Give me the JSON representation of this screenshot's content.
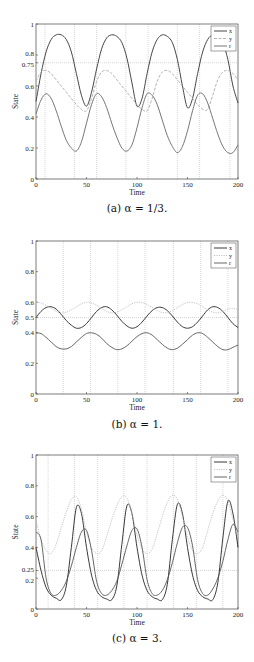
{
  "chart_data": [
    {
      "type": "line",
      "caption": "(a) α = 1/3.",
      "xlabel": "Time",
      "ylabel": "State",
      "xlim": [
        0,
        200
      ],
      "ylim": [
        0,
        1
      ],
      "xticks": [
        "0",
        "50",
        "100",
        "150",
        "200"
      ],
      "xtick_values": [
        0,
        50,
        100,
        150,
        200
      ],
      "yticks": [
        "0",
        "0.2",
        "0.4",
        "0.6",
        "0.75",
        "0.8",
        "1"
      ],
      "ytick_values": [
        0,
        0.2,
        0.4,
        0.6,
        0.75,
        0.8,
        1
      ],
      "hline": 0.75,
      "vlines": [
        9,
        38,
        60,
        89,
        111,
        140,
        162,
        192
      ],
      "legend": [
        "x",
        "y",
        "r"
      ],
      "legend_position": "top-right",
      "x": [
        0,
        5,
        10,
        15,
        20,
        25,
        30,
        35,
        40,
        45,
        50,
        55,
        60,
        65,
        70,
        75,
        80,
        85,
        90,
        95,
        100,
        105,
        110,
        115,
        120,
        125,
        130,
        135,
        140,
        145,
        150,
        155,
        160,
        165,
        170,
        175,
        180,
        185,
        190,
        195,
        200
      ],
      "series": [
        {
          "name": "x",
          "style": "solid",
          "color": "#333333",
          "values": [
            0.5,
            0.68,
            0.82,
            0.9,
            0.93,
            0.93,
            0.9,
            0.82,
            0.68,
            0.54,
            0.47,
            0.56,
            0.71,
            0.84,
            0.91,
            0.93,
            0.92,
            0.88,
            0.78,
            0.62,
            0.47,
            0.52,
            0.68,
            0.82,
            0.9,
            0.93,
            0.92,
            0.88,
            0.77,
            0.6,
            0.46,
            0.52,
            0.68,
            0.82,
            0.9,
            0.93,
            0.92,
            0.88,
            0.77,
            0.6,
            0.49
          ]
        },
        {
          "name": "y",
          "style": "dashed",
          "color": "#aaaaaa",
          "values": [
            0.63,
            0.69,
            0.7,
            0.68,
            0.64,
            0.6,
            0.56,
            0.52,
            0.48,
            0.45,
            0.44,
            0.52,
            0.63,
            0.69,
            0.7,
            0.68,
            0.64,
            0.6,
            0.56,
            0.52,
            0.48,
            0.45,
            0.44,
            0.52,
            0.63,
            0.69,
            0.7,
            0.68,
            0.64,
            0.6,
            0.56,
            0.52,
            0.48,
            0.45,
            0.45,
            0.54,
            0.64,
            0.69,
            0.7,
            0.68,
            0.64
          ]
        },
        {
          "name": "r",
          "style": "solid",
          "color": "#666666",
          "values": [
            0.42,
            0.51,
            0.55,
            0.52,
            0.44,
            0.34,
            0.25,
            0.2,
            0.18,
            0.24,
            0.36,
            0.48,
            0.55,
            0.53,
            0.46,
            0.36,
            0.27,
            0.2,
            0.18,
            0.22,
            0.33,
            0.46,
            0.55,
            0.54,
            0.48,
            0.38,
            0.28,
            0.21,
            0.17,
            0.21,
            0.31,
            0.44,
            0.54,
            0.55,
            0.49,
            0.39,
            0.29,
            0.21,
            0.17,
            0.17,
            0.22
          ]
        }
      ]
    },
    {
      "type": "line",
      "caption": "(b) α = 1.",
      "xlabel": "Time",
      "ylabel": "State",
      "xlim": [
        0,
        200
      ],
      "ylim": [
        0,
        1
      ],
      "xticks": [
        "0",
        "50",
        "100",
        "150",
        "200"
      ],
      "xtick_values": [
        0,
        50,
        100,
        150,
        200
      ],
      "yticks": [
        "0",
        "0.2",
        "0.4",
        "0.5",
        "0.6",
        "0.8",
        "1"
      ],
      "ytick_values": [
        0,
        0.2,
        0.4,
        0.5,
        0.6,
        0.8,
        1
      ],
      "hline": 0.5,
      "vlines": [
        27,
        54,
        81,
        108,
        136,
        163,
        190
      ],
      "legend": [
        "x",
        "y",
        "r"
      ],
      "legend_position": "top-right",
      "x": [
        0,
        5,
        10,
        15,
        20,
        25,
        30,
        35,
        40,
        45,
        50,
        55,
        60,
        65,
        70,
        75,
        80,
        85,
        90,
        95,
        100,
        105,
        110,
        115,
        120,
        125,
        130,
        135,
        140,
        145,
        150,
        155,
        160,
        165,
        170,
        175,
        180,
        185,
        190,
        195,
        200
      ],
      "series": [
        {
          "name": "x",
          "style": "solid",
          "color": "#222222",
          "values": [
            0.5,
            0.54,
            0.565,
            0.57,
            0.555,
            0.52,
            0.48,
            0.45,
            0.43,
            0.435,
            0.46,
            0.5,
            0.54,
            0.565,
            0.57,
            0.55,
            0.515,
            0.475,
            0.445,
            0.43,
            0.44,
            0.47,
            0.51,
            0.545,
            0.565,
            0.565,
            0.545,
            0.51,
            0.47,
            0.44,
            0.43,
            0.44,
            0.47,
            0.51,
            0.55,
            0.57,
            0.565,
            0.54,
            0.5,
            0.46,
            0.435
          ]
        },
        {
          "name": "y",
          "style": "dotted",
          "color": "#bbbbbb",
          "values": [
            0.6,
            0.595,
            0.58,
            0.56,
            0.54,
            0.53,
            0.535,
            0.55,
            0.57,
            0.59,
            0.6,
            0.595,
            0.58,
            0.56,
            0.54,
            0.53,
            0.535,
            0.55,
            0.57,
            0.59,
            0.6,
            0.597,
            0.585,
            0.565,
            0.545,
            0.532,
            0.532,
            0.545,
            0.565,
            0.585,
            0.598,
            0.598,
            0.59,
            0.57,
            0.55,
            0.535,
            0.53,
            0.54,
            0.555,
            0.56,
            0.55
          ]
        },
        {
          "name": "r",
          "style": "solid",
          "color": "#555555",
          "values": [
            0.4,
            0.395,
            0.37,
            0.34,
            0.31,
            0.295,
            0.295,
            0.31,
            0.34,
            0.37,
            0.395,
            0.4,
            0.39,
            0.365,
            0.33,
            0.305,
            0.29,
            0.295,
            0.315,
            0.345,
            0.375,
            0.395,
            0.4,
            0.385,
            0.355,
            0.325,
            0.3,
            0.29,
            0.3,
            0.325,
            0.355,
            0.385,
            0.4,
            0.395,
            0.37,
            0.34,
            0.31,
            0.29,
            0.29,
            0.305,
            0.32
          ]
        }
      ]
    },
    {
      "type": "line",
      "caption": "(c) α = 3.",
      "xlabel": "Time",
      "ylabel": "State",
      "xlim": [
        0,
        200
      ],
      "ylim": [
        0,
        1
      ],
      "xticks": [
        "0",
        "50",
        "100",
        "150",
        "200"
      ],
      "xtick_values": [
        0,
        50,
        100,
        150,
        200
      ],
      "yticks": [
        "0",
        "0.2",
        "0.25",
        "0.4",
        "0.6",
        "0.8",
        "1"
      ],
      "ytick_values": [
        0,
        0.2,
        0.25,
        0.4,
        0.6,
        0.8,
        1
      ],
      "hline": 0.25,
      "vlines": [
        12,
        38,
        61,
        87,
        110,
        136,
        159,
        185
      ],
      "legend": [
        "x",
        "y",
        "r"
      ],
      "legend_position": "top-right",
      "x": [
        0,
        5,
        10,
        15,
        20,
        25,
        30,
        35,
        40,
        45,
        50,
        55,
        60,
        65,
        70,
        75,
        80,
        85,
        90,
        95,
        100,
        105,
        110,
        115,
        120,
        125,
        130,
        135,
        140,
        145,
        150,
        155,
        160,
        165,
        170,
        175,
        180,
        185,
        190,
        195,
        200
      ],
      "series": [
        {
          "name": "x",
          "style": "solid",
          "color": "#222222",
          "values": [
            0.4,
            0.25,
            0.14,
            0.09,
            0.07,
            0.06,
            0.15,
            0.4,
            0.66,
            0.62,
            0.4,
            0.22,
            0.12,
            0.08,
            0.065,
            0.06,
            0.15,
            0.42,
            0.67,
            0.62,
            0.4,
            0.22,
            0.12,
            0.08,
            0.065,
            0.06,
            0.16,
            0.45,
            0.68,
            0.62,
            0.4,
            0.22,
            0.12,
            0.08,
            0.065,
            0.06,
            0.17,
            0.46,
            0.7,
            0.62,
            0.4
          ]
        },
        {
          "name": "y",
          "style": "dotted",
          "color": "#bbbbbb",
          "values": [
            0.58,
            0.45,
            0.38,
            0.36,
            0.42,
            0.53,
            0.63,
            0.71,
            0.73,
            0.65,
            0.5,
            0.4,
            0.36,
            0.38,
            0.47,
            0.58,
            0.67,
            0.73,
            0.72,
            0.62,
            0.48,
            0.39,
            0.36,
            0.39,
            0.49,
            0.6,
            0.69,
            0.74,
            0.71,
            0.6,
            0.47,
            0.38,
            0.36,
            0.4,
            0.51,
            0.62,
            0.7,
            0.74,
            0.7,
            0.58,
            0.46
          ]
        },
        {
          "name": "r",
          "style": "solid",
          "color": "#555555",
          "values": [
            0.5,
            0.45,
            0.2,
            0.1,
            0.09,
            0.12,
            0.18,
            0.28,
            0.4,
            0.5,
            0.51,
            0.38,
            0.18,
            0.1,
            0.09,
            0.12,
            0.18,
            0.29,
            0.41,
            0.51,
            0.52,
            0.4,
            0.19,
            0.1,
            0.09,
            0.12,
            0.19,
            0.3,
            0.43,
            0.53,
            0.53,
            0.41,
            0.19,
            0.1,
            0.09,
            0.13,
            0.2,
            0.31,
            0.45,
            0.55,
            0.5
          ]
        }
      ]
    }
  ]
}
